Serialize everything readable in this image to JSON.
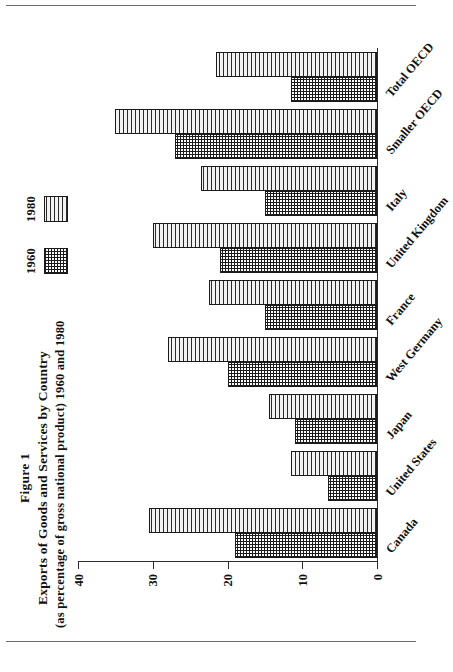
{
  "figure": {
    "title_line1": "Figure 1",
    "title_line2": "Exports of Goods and Services by Country",
    "title_line3": "(as percentage of gross national product) 1960 and 1980"
  },
  "legend": {
    "items": [
      {
        "label": "1960",
        "pattern": "cross-hatch",
        "color": "#1c1c1c"
      },
      {
        "label": "1980",
        "pattern": "horizontal-lines",
        "color": "#2a2a2a"
      }
    ]
  },
  "axis": {
    "ticks": [
      "0",
      "10",
      "20",
      "30",
      "40"
    ]
  },
  "chart_data": {
    "type": "bar",
    "title": "Exports of Goods and Services by Country (as percentage of gross national product) 1960 and 1980",
    "xlabel": "",
    "ylabel": "",
    "ylim": [
      0,
      40
    ],
    "grid": false,
    "legend_position": "top-right",
    "orientation": "vertical",
    "categories": [
      "Canada",
      "United States",
      "Japan",
      "West Germany",
      "France",
      "United Kingdom",
      "Italy",
      "Smaller OECD",
      "Total OECD"
    ],
    "series": [
      {
        "name": "1960",
        "values": [
          19.0,
          6.5,
          11.0,
          20.0,
          15.0,
          21.0,
          15.0,
          27.0,
          11.5
        ]
      },
      {
        "name": "1980",
        "values": [
          30.5,
          11.5,
          14.5,
          28.0,
          22.5,
          30.0,
          23.5,
          35.0,
          21.5
        ]
      }
    ]
  }
}
